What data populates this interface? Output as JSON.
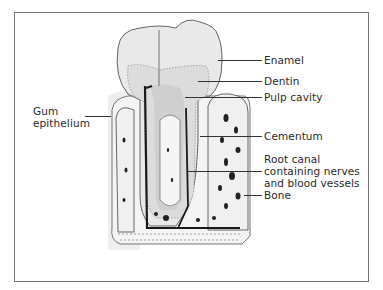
{
  "figure": {
    "type": "anatomical-diagram"
  },
  "labels": [
    {
      "id": "enamel",
      "text": "Enamel"
    },
    {
      "id": "dentin",
      "text": "Dentin"
    },
    {
      "id": "pulp_cavity",
      "text": "Pulp cavity"
    },
    {
      "id": "cementum",
      "text": "Cementum"
    },
    {
      "id": "root_canal",
      "lines": [
        "Root canal",
        "containing nerves",
        "and blood vessels"
      ]
    },
    {
      "id": "bone",
      "text": "Bone"
    },
    {
      "id": "gum_epithelium",
      "lines": [
        "Gum",
        "epithelium"
      ]
    }
  ],
  "colors": {
    "frame": "#777777",
    "ink": "#2a2a2a",
    "enamel": "#e9e9e9",
    "dentin": "#d8d8d8",
    "bone": "#f2f2f2",
    "canal": "#1a1a1a"
  }
}
